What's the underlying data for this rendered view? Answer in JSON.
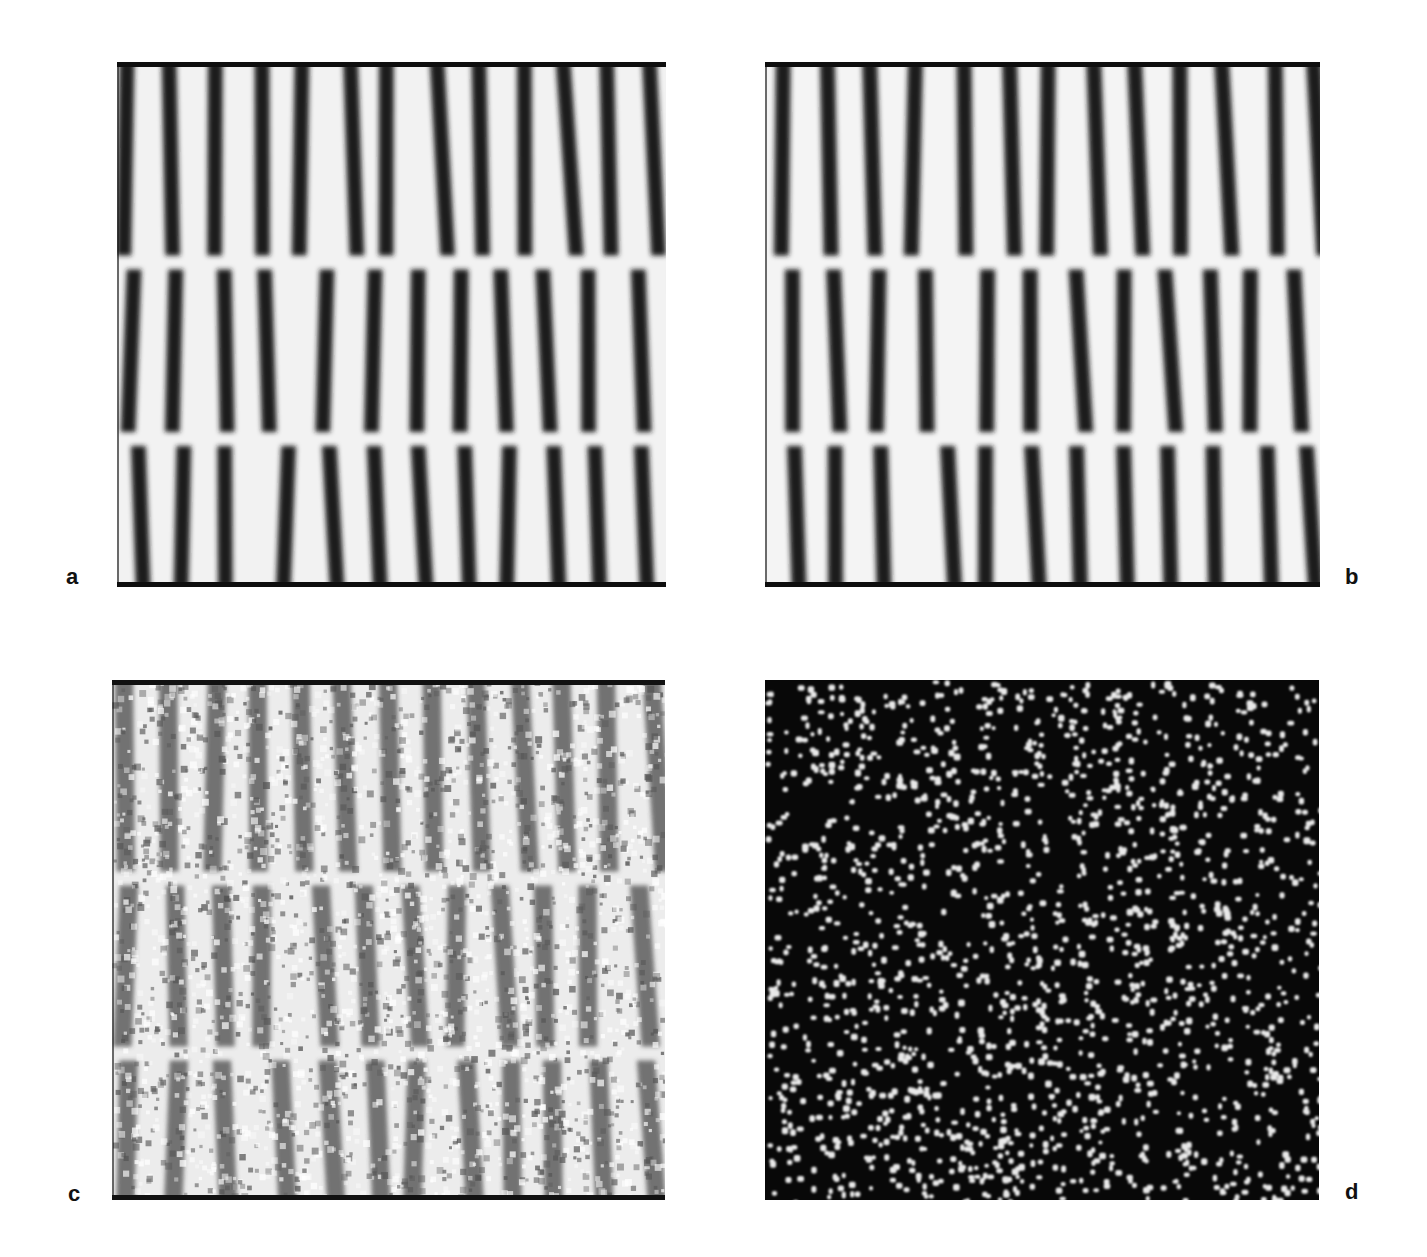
{
  "figure": {
    "panels": [
      {
        "id": "a",
        "label": "a",
        "kind": "stripes-clean",
        "bg": "#f2f2f2",
        "stripe": "#1e1e1e",
        "frame": "#0e0e0e"
      },
      {
        "id": "b",
        "label": "b",
        "kind": "stripes-clean",
        "bg": "#f4f4f4",
        "stripe": "#1a1a1a",
        "frame": "#0e0e0e"
      },
      {
        "id": "c",
        "label": "c",
        "kind": "stripes-noisy",
        "bg": "#ececec",
        "stripe": "#4a4a4a",
        "frame": "#111111"
      },
      {
        "id": "d",
        "label": "d",
        "kind": "random-dots",
        "bg": "#080808",
        "dot": "#e8e8e8",
        "frame": "#000000"
      }
    ],
    "stripe_count": 13,
    "stripe_period_px": 42,
    "defect_band_y": [
      0.38,
      0.72
    ]
  }
}
